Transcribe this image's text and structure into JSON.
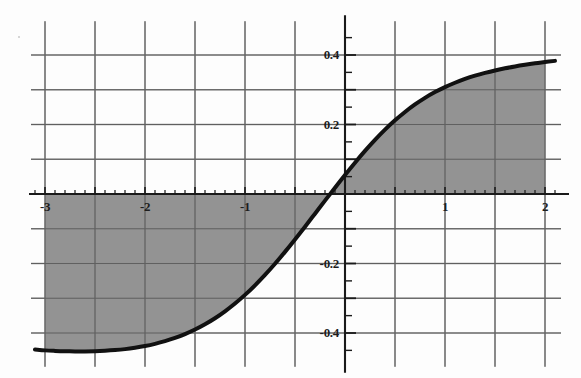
{
  "chart_data": {
    "type": "line",
    "title": "",
    "subtitle": "",
    "xlabel": "",
    "ylabel": "",
    "xlim": [
      -3.1,
      2.1
    ],
    "ylim": [
      -0.48,
      0.48
    ],
    "grid": true,
    "legend": null,
    "legend_position": "none",
    "x_ticks_major": [
      -3,
      -2,
      -1,
      1,
      2
    ],
    "x_tick_labels": [
      "-3",
      "-2",
      "-1",
      "1",
      "2"
    ],
    "x_gridline_values": [
      -3,
      -2.5,
      -2,
      -1.5,
      -1,
      -0.5,
      0,
      0.5,
      1,
      1.5,
      2
    ],
    "x_minor_tick_step": 0.1,
    "y_ticks_major": [
      0.4,
      0.2,
      -0.2,
      -0.4
    ],
    "y_tick_labels": [
      "0.4",
      "0.2",
      "-0.2",
      "-0.4"
    ],
    "y_gridline_values": [
      0.4,
      0.3,
      0.2,
      0.1,
      0,
      -0.1,
      -0.2,
      -0.3,
      -0.4
    ],
    "y_minor_tick_step": 0.05,
    "series": [
      {
        "name": "curve",
        "style": "solid",
        "color": "#111111",
        "line_width": 4,
        "fill_to_zero": true,
        "fill_color": "#8f8f8f",
        "x": [
          -3.1,
          -3.0,
          -2.9,
          -2.8,
          -2.7,
          -2.6,
          -2.5,
          -2.4,
          -2.3,
          -2.2,
          -2.1,
          -2.0,
          -1.9,
          -1.8,
          -1.7,
          -1.6,
          -1.5,
          -1.4,
          -1.3,
          -1.2,
          -1.1,
          -1.0,
          -0.9,
          -0.8,
          -0.7,
          -0.6,
          -0.5,
          -0.4,
          -0.3,
          -0.2,
          -0.1,
          0.0,
          0.1,
          0.2,
          0.3,
          0.4,
          0.5,
          0.6,
          0.7,
          0.8,
          0.9,
          1.0,
          1.1,
          1.2,
          1.3,
          1.4,
          1.5,
          1.6,
          1.7,
          1.8,
          1.9,
          2.0,
          2.1
        ],
        "y": [
          -0.4475,
          -0.45,
          -0.4515,
          -0.4525,
          -0.453,
          -0.453,
          -0.4525,
          -0.4512,
          -0.4492,
          -0.4464,
          -0.4425,
          -0.4375,
          -0.4312,
          -0.4235,
          -0.4142,
          -0.403,
          -0.39,
          -0.3748,
          -0.3574,
          -0.3375,
          -0.3152,
          -0.2903,
          -0.2628,
          -0.2329,
          -0.2007,
          -0.1665,
          -0.1308,
          -0.094,
          -0.0566,
          -0.019,
          0.0182,
          0.0548,
          0.0902,
          0.124,
          0.1557,
          0.1851,
          0.2119,
          0.2361,
          0.2577,
          0.2767,
          0.2933,
          0.3077,
          0.3202,
          0.331,
          0.3404,
          0.3485,
          0.3556,
          0.3617,
          0.3671,
          0.3719,
          0.3761,
          0.3798,
          0.3831
        ]
      }
    ],
    "shaded_region": {
      "description": "area between curve and y=0 axis",
      "color": "#8f8f8f",
      "x_range": [
        -3.0,
        2.0
      ]
    },
    "axes": {
      "x_axis_at_y": 0,
      "y_axis_at_x": 0,
      "axis_color": "#1a1a1a",
      "grid_color": "#909090"
    }
  },
  "figure": {
    "background": "#fdfdfd",
    "curve_color": "#111111",
    "fill_color": "#8f8f8f",
    "grid_color": "#909090",
    "axis_color": "#1a1a1a"
  }
}
